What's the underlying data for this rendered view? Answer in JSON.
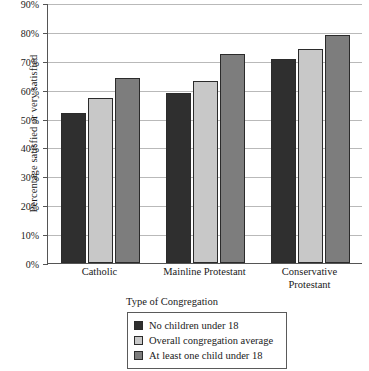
{
  "chart_data": {
    "type": "bar",
    "title": "",
    "xlabel": "Type of Congregation",
    "ylabel": "Percentage satisfied or very satisfied",
    "categories": [
      "Catholic",
      "Mainline Protestant",
      "Conservative Protestant"
    ],
    "category_lines": [
      [
        "Catholic"
      ],
      [
        "Mainline Protestant"
      ],
      [
        "Conservative",
        "Protestant"
      ]
    ],
    "series": [
      {
        "name": "No children under 18",
        "color": "#2f2f2f",
        "values": [
          52,
          59,
          70.5
        ]
      },
      {
        "name": "Overall congregation average",
        "color": "#c8c8c8",
        "values": [
          57,
          63,
          74
        ]
      },
      {
        "name": "At least one child under 18",
        "color": "#7d7d7d",
        "values": [
          64,
          72.5,
          79
        ]
      }
    ],
    "ylim": [
      0,
      90
    ],
    "ytick_values": [
      0,
      10,
      20,
      30,
      40,
      50,
      60,
      70,
      80,
      90
    ],
    "ytick_labels": [
      "0%",
      "10%",
      "20%",
      "30%",
      "40%",
      "50%",
      "60%",
      "70%",
      "80%",
      "90%"
    ],
    "grid": true,
    "legend_position": "bottom-center"
  }
}
